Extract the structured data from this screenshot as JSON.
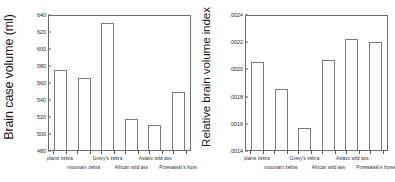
{
  "figure": {
    "panels": [
      {
        "id": "brain-case-volume",
        "ylabel": "Brain case volume (ml)"
      },
      {
        "id": "relative-brain-volume-index",
        "ylabel": "Relative brain volume index"
      }
    ]
  },
  "chart_data": [
    {
      "type": "bar",
      "title": "",
      "xlabel": "",
      "ylabel": "Brain case volume (ml)",
      "categories": [
        "plains zebra",
        "mountain zebra",
        "Grevy's zebra",
        "African wild ass",
        "Asiatic wild ass",
        "Przewalski's horse"
      ],
      "values": [
        574,
        565,
        630,
        517,
        509,
        548
      ],
      "ylim": [
        480,
        640
      ],
      "yticks": [
        480,
        500,
        520,
        540,
        560,
        580,
        600,
        620,
        640
      ],
      "ytick_labels": [
        "480",
        "500",
        "520",
        "540",
        "560",
        "580",
        "600",
        "620",
        "640"
      ],
      "grid": false,
      "legend": "none"
    },
    {
      "type": "bar",
      "title": "",
      "xlabel": "",
      "ylabel": "Relative brain volume index",
      "categories": [
        "plains zebra",
        "mountain zebra",
        "Grevy's zebra",
        "African wild ass",
        "Asiatic wild ass",
        "Przewalski's horse"
      ],
      "values": [
        0.00205,
        0.00185,
        0.001565,
        0.002065,
        0.002215,
        0.002195
      ],
      "ylim": [
        0.0014,
        0.0024
      ],
      "yticks": [
        0.0014,
        0.0016,
        0.0018,
        0.002,
        0.0022,
        0.0024
      ],
      "ytick_labels": [
        ".0014",
        ".0016",
        ".0018",
        ".0020",
        ".0022",
        ".0024"
      ],
      "grid": false,
      "legend": "none"
    }
  ],
  "colors": {
    "bar_fill": "#ffffff",
    "bar_stroke": "#7a7a7a",
    "axis": "#6b6b6b",
    "text": "#1a1a1a"
  }
}
